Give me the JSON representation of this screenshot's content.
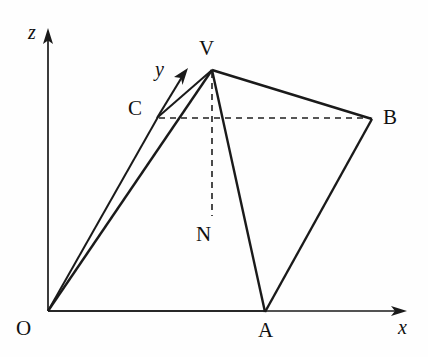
{
  "figure": {
    "kind": "3d-coordinate-geometry-diagram",
    "canvas": {
      "width": 428,
      "height": 357
    },
    "background_color": "#fefefe",
    "ink_color": "#1a1a1a"
  },
  "axes": [
    {
      "id": "z",
      "label": "z",
      "label_x": 28,
      "label_y": 22,
      "from": [
        48,
        311
      ],
      "to": [
        48,
        36
      ],
      "arrow": "up"
    },
    {
      "id": "y",
      "label": "y",
      "label_x": 155,
      "label_y": 59,
      "from": [
        158,
        117
      ],
      "to": [
        186,
        72
      ],
      "arrow": "up-right"
    },
    {
      "id": "x",
      "label": "x",
      "label_x": 398,
      "label_y": 317,
      "from": [
        48,
        311
      ],
      "to": [
        402,
        311
      ],
      "arrow": "right"
    }
  ],
  "points": [
    {
      "id": "O",
      "label": "O",
      "x": 48,
      "y": 311,
      "label_x": 16,
      "label_y": 318
    },
    {
      "id": "V",
      "label": "V",
      "x": 212,
      "y": 70,
      "label_x": 199,
      "label_y": 38
    },
    {
      "id": "C",
      "label": "C",
      "x": 158,
      "y": 117,
      "label_x": 128,
      "label_y": 98
    },
    {
      "id": "B",
      "label": "B",
      "x": 372,
      "y": 119,
      "label_x": 383,
      "label_y": 107
    },
    {
      "id": "A",
      "label": "A",
      "x": 265,
      "y": 312,
      "label_x": 258,
      "label_y": 320
    },
    {
      "id": "N",
      "label": "N",
      "x": 212,
      "y": 218,
      "label_x": 196,
      "label_y": 224
    }
  ],
  "solid_edges": [
    {
      "id": "edge-O-V",
      "from": "O",
      "to": "V"
    },
    {
      "id": "edge-O-C",
      "from": "O",
      "to": "C"
    },
    {
      "id": "edge-C-V",
      "from": "C",
      "to": "V"
    },
    {
      "id": "edge-V-B",
      "from": "V",
      "to": "B"
    },
    {
      "id": "edge-B-A",
      "from": "B",
      "to": "A"
    },
    {
      "id": "edge-A-V",
      "from": "A",
      "to": "V"
    },
    {
      "id": "edge-O-A",
      "from": "O",
      "to": "A"
    }
  ],
  "dashed_edges": [
    {
      "id": "edge-C-B",
      "from": "C",
      "to": "B",
      "note": "hidden base edge"
    },
    {
      "id": "edge-V-N",
      "from": "V",
      "to": "N",
      "note": "altitude from apex to base"
    }
  ]
}
